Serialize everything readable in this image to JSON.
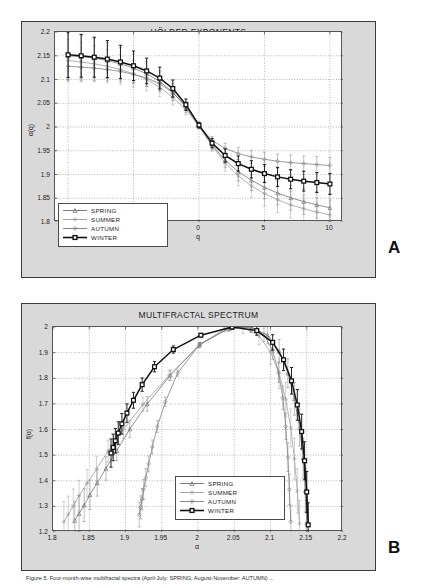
{
  "figure": {
    "panel_a_letter": "A",
    "panel_b_letter": "B",
    "caption": "Figure 5. Four-month-wise multifractal spectra (April-July: SPRING; August-November: AUTUMN) ..."
  },
  "legend": {
    "entries": [
      {
        "label": "SPRING",
        "color": "#6e6e6e",
        "marker": "triangle-marker",
        "width": 1.0
      },
      {
        "label": "SUMMER",
        "color": "#9a9a9a",
        "marker": "star-marker",
        "width": 1.0
      },
      {
        "label": "AUTUMN",
        "color": "#7a7a7a",
        "marker": "diamond-marker",
        "width": 1.0
      },
      {
        "label": "WINTER",
        "color": "#111111",
        "marker": "square-marker",
        "width": 1.8
      }
    ]
  },
  "chart_data": [
    {
      "type": "line",
      "id": "holder-exponents",
      "title": "HÖLDER EXPONENTS",
      "xlabel": "q",
      "ylabel": "α(q)",
      "xlim": [
        -11,
        11
      ],
      "ylim": [
        1.8,
        2.2
      ],
      "xticks": [
        -10,
        -5,
        0,
        5,
        10
      ],
      "xtick_labels": [
        "-10",
        "-5",
        "0",
        "5",
        "10"
      ],
      "yticks": [
        1.8,
        1.85,
        1.9,
        1.95,
        2,
        2.05,
        2.1,
        2.15,
        2.2
      ],
      "ytick_labels": [
        "1.8",
        "1.85",
        "1.9",
        "1.95",
        "2",
        "2.05",
        "2.1",
        "2.15",
        "2.2"
      ],
      "grid": true,
      "legend_position": "lower-left",
      "x": [
        -10,
        -9,
        -8,
        -7,
        -6,
        -5,
        -4,
        -3,
        -2,
        -1,
        0,
        1,
        2,
        3,
        4,
        5,
        6,
        7,
        8,
        9,
        10
      ],
      "series": [
        {
          "name": "SPRING",
          "color": "#6e6e6e",
          "marker": "triangle-marker",
          "values": [
            2.15,
            2.148,
            2.145,
            2.14,
            2.133,
            2.124,
            2.112,
            2.096,
            2.073,
            2.042,
            2.002,
            1.962,
            1.93,
            1.906,
            1.888,
            1.873,
            1.861,
            1.851,
            1.843,
            1.836,
            1.83
          ],
          "err": [
            0.05,
            0.046,
            0.042,
            0.038,
            0.034,
            0.03,
            0.026,
            0.022,
            0.018,
            0.012,
            0.006,
            0.01,
            0.016,
            0.02,
            0.022,
            0.024,
            0.025,
            0.026,
            0.027,
            0.028,
            0.029
          ]
        },
        {
          "name": "SUMMER",
          "color": "#9a9a9a",
          "marker": "star-marker",
          "values": [
            2.14,
            2.137,
            2.133,
            2.128,
            2.121,
            2.112,
            2.1,
            2.084,
            2.062,
            2.037,
            2.001,
            1.96,
            1.924,
            1.897,
            1.876,
            1.86,
            1.847,
            1.836,
            1.828,
            1.821,
            1.815
          ],
          "err": [
            0.045,
            0.042,
            0.038,
            0.035,
            0.031,
            0.028,
            0.024,
            0.02,
            0.016,
            0.011,
            0.005,
            0.011,
            0.017,
            0.021,
            0.024,
            0.026,
            0.027,
            0.028,
            0.029,
            0.03,
            0.031
          ]
        },
        {
          "name": "AUTUMN",
          "color": "#7a7a7a",
          "marker": "diamond-marker",
          "values": [
            2.128,
            2.126,
            2.124,
            2.121,
            2.117,
            2.111,
            2.103,
            2.091,
            2.073,
            2.044,
            2.003,
            1.972,
            1.955,
            1.944,
            1.937,
            1.932,
            1.928,
            1.925,
            1.923,
            1.921,
            1.919
          ],
          "err": [
            0.03,
            0.028,
            0.026,
            0.024,
            0.022,
            0.019,
            0.017,
            0.014,
            0.011,
            0.008,
            0.004,
            0.008,
            0.011,
            0.013,
            0.014,
            0.015,
            0.015,
            0.016,
            0.016,
            0.017,
            0.017
          ]
        },
        {
          "name": "WINTER",
          "color": "#111111",
          "marker": "square-marker",
          "values": [
            2.152,
            2.15,
            2.147,
            2.143,
            2.137,
            2.129,
            2.118,
            2.103,
            2.081,
            2.047,
            2.004,
            1.966,
            1.94,
            1.923,
            1.911,
            1.902,
            1.895,
            1.89,
            1.886,
            1.883,
            1.88
          ],
          "err": [
            0.048,
            0.045,
            0.042,
            0.039,
            0.035,
            0.031,
            0.027,
            0.023,
            0.018,
            0.012,
            0.006,
            0.01,
            0.014,
            0.016,
            0.018,
            0.019,
            0.02,
            0.02,
            0.021,
            0.021,
            0.022
          ]
        }
      ]
    },
    {
      "type": "line",
      "id": "multifractal-spectrum",
      "title": "MULTIFRACTAL SPECTRUM",
      "xlabel": "α",
      "ylabel": "f(α)",
      "xlim": [
        1.8,
        2.2
      ],
      "ylim": [
        1.2,
        2.0
      ],
      "xticks": [
        1.8,
        1.85,
        1.9,
        1.95,
        2,
        2.05,
        2.1,
        2.15,
        2.2
      ],
      "xtick_labels": [
        "1.8",
        "1.85",
        "1.9",
        "1.95",
        "2",
        "2.05",
        "2.1",
        "2.15",
        "2.2"
      ],
      "yticks": [
        1.2,
        1.3,
        1.4,
        1.5,
        1.6,
        1.7,
        1.8,
        1.9,
        2
      ],
      "ytick_labels": [
        "1.2",
        "1.3",
        "1.4",
        "1.5",
        "1.6",
        "1.7",
        "1.8",
        "1.9",
        "2"
      ],
      "grid": true,
      "legend_position": "lower-center",
      "series": [
        {
          "name": "SPRING",
          "color": "#6e6e6e",
          "marker": "triangle-marker",
          "x": [
            1.83,
            1.836,
            1.843,
            1.851,
            1.861,
            1.873,
            1.888,
            1.906,
            1.93,
            1.962,
            2.002,
            2.042,
            2.073,
            2.096,
            2.112,
            2.124,
            2.133,
            2.14,
            2.145,
            2.148,
            2.15
          ],
          "y": [
            1.245,
            1.272,
            1.305,
            1.345,
            1.392,
            1.448,
            1.518,
            1.602,
            1.7,
            1.812,
            1.93,
            1.995,
            2.0,
            1.968,
            1.905,
            1.82,
            1.72,
            1.608,
            1.488,
            1.362,
            1.235
          ],
          "err": [
            0.075,
            0.07,
            0.064,
            0.058,
            0.052,
            0.046,
            0.04,
            0.034,
            0.028,
            0.02,
            0.01,
            0.012,
            0.022,
            0.034,
            0.046,
            0.056,
            0.064,
            0.072,
            0.078,
            0.084,
            0.09
          ]
        },
        {
          "name": "SUMMER",
          "color": "#9a9a9a",
          "marker": "star-marker",
          "x": [
            1.815,
            1.821,
            1.828,
            1.836,
            1.847,
            1.86,
            1.876,
            1.897,
            1.924,
            1.96,
            2.001,
            2.037,
            2.062,
            2.084,
            2.1,
            2.112,
            2.121,
            2.128,
            2.133,
            2.137,
            2.14
          ],
          "y": [
            1.24,
            1.268,
            1.302,
            1.342,
            1.39,
            1.446,
            1.516,
            1.6,
            1.698,
            1.81,
            1.928,
            1.993,
            1.999,
            1.966,
            1.902,
            1.818,
            1.718,
            1.606,
            1.486,
            1.36,
            1.232
          ],
          "err": [
            0.078,
            0.072,
            0.066,
            0.06,
            0.054,
            0.048,
            0.042,
            0.035,
            0.028,
            0.02,
            0.01,
            0.013,
            0.024,
            0.036,
            0.048,
            0.058,
            0.066,
            0.074,
            0.08,
            0.086,
            0.092
          ]
        },
        {
          "name": "AUTUMN",
          "color": "#7a7a7a",
          "marker": "diamond-marker",
          "x": [
            1.919,
            1.921,
            1.923,
            1.925,
            1.928,
            1.932,
            1.937,
            1.944,
            1.955,
            1.972,
            2.003,
            2.044,
            2.073,
            2.091,
            2.103,
            2.111,
            2.117,
            2.121,
            2.124,
            2.126,
            2.128
          ],
          "y": [
            1.268,
            1.296,
            1.328,
            1.366,
            1.412,
            1.466,
            1.532,
            1.612,
            1.708,
            1.82,
            1.934,
            1.996,
            2.0,
            1.97,
            1.908,
            1.824,
            1.724,
            1.612,
            1.492,
            1.366,
            1.24
          ],
          "err": [
            0.048,
            0.045,
            0.042,
            0.039,
            0.035,
            0.031,
            0.027,
            0.023,
            0.018,
            0.012,
            0.006,
            0.01,
            0.018,
            0.026,
            0.034,
            0.04,
            0.046,
            0.051,
            0.056,
            0.06,
            0.064
          ]
        },
        {
          "name": "WINTER",
          "color": "#111111",
          "marker": "square-marker",
          "x": [
            1.88,
            1.883,
            1.886,
            1.89,
            1.895,
            1.902,
            1.911,
            1.923,
            1.94,
            1.966,
            2.004,
            2.047,
            2.081,
            2.103,
            2.118,
            2.129,
            2.137,
            2.143,
            2.147,
            2.15,
            2.152
          ],
          "y": [
            1.508,
            1.53,
            1.556,
            1.586,
            1.622,
            1.664,
            1.714,
            1.775,
            1.845,
            1.912,
            1.968,
            2.0,
            1.986,
            1.94,
            1.872,
            1.79,
            1.696,
            1.592,
            1.478,
            1.356,
            1.228
          ],
          "err": [
            0.055,
            0.052,
            0.048,
            0.044,
            0.04,
            0.036,
            0.031,
            0.026,
            0.02,
            0.014,
            0.007,
            0.009,
            0.018,
            0.03,
            0.042,
            0.052,
            0.06,
            0.068,
            0.074,
            0.08,
            0.086
          ]
        }
      ]
    }
  ]
}
